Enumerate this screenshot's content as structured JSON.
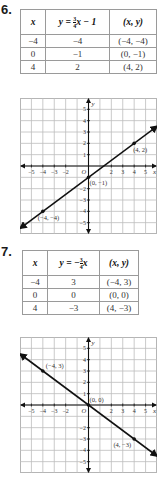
{
  "problems": [
    {
      "number": "6.",
      "table": {
        "headers": [
          "x",
          "y = 3/4x − 1",
          "(x, y)"
        ],
        "header_parts": {
          "y_prefix": "y = ",
          "frac_num": "3",
          "frac_den": "4",
          "y_suffix": "x − 1"
        },
        "rows": [
          [
            "−4",
            "−4",
            "(−4, −4)"
          ],
          [
            "0",
            "−1",
            "(0, −1)"
          ],
          [
            "4",
            "2",
            "(4, 2)"
          ]
        ]
      },
      "graph": {
        "x_label": "x",
        "y_label": "y",
        "origin_label": "O",
        "point_labels": [
          "(4, 2)",
          "(0, −1)",
          "(−4, −4)"
        ]
      }
    },
    {
      "number": "7.",
      "table": {
        "headers": [
          "x",
          "y = −3/4x",
          "(x, y)"
        ],
        "header_parts": {
          "y_prefix": "y = −",
          "frac_num": "3",
          "frac_den": "4",
          "y_suffix": "x"
        },
        "rows": [
          [
            "−4",
            "3",
            "(−4, 3)"
          ],
          [
            "0",
            "0",
            "(0, 0)"
          ],
          [
            "4",
            "−3",
            "(4, −3)"
          ]
        ]
      },
      "graph": {
        "x_label": "x",
        "y_label": "y",
        "origin_label": "O",
        "point_labels": [
          "(−4, 3)",
          "(0, 0)",
          "(4, −3)"
        ]
      }
    }
  ],
  "chart_data": [
    {
      "type": "line",
      "title": "y = 3/4x − 1",
      "xlabel": "x",
      "ylabel": "y",
      "xlim": [
        -6,
        6
      ],
      "ylim": [
        -6,
        6
      ],
      "grid": true,
      "x_ticks": [
        -5,
        -4,
        -3,
        -2,
        2,
        3,
        4,
        5
      ],
      "y_ticks": [
        -5,
        -4,
        -3,
        -2,
        1,
        2,
        3,
        4,
        5
      ],
      "points": [
        {
          "x": -4,
          "y": -4,
          "label": "(−4, −4)"
        },
        {
          "x": 0,
          "y": -1,
          "label": "(0, −1)"
        },
        {
          "x": 4,
          "y": 2,
          "label": "(4, 2)"
        }
      ],
      "slope": 0.75,
      "intercept": -1
    },
    {
      "type": "line",
      "title": "y = −3/4x",
      "xlabel": "x",
      "ylabel": "y",
      "xlim": [
        -6,
        6
      ],
      "ylim": [
        -6,
        6
      ],
      "grid": true,
      "x_ticks": [
        -5,
        -4,
        -3,
        -2,
        2,
        3,
        4,
        5
      ],
      "y_ticks": [
        -5,
        -4,
        -3,
        -2,
        1,
        2,
        3,
        4,
        5
      ],
      "points": [
        {
          "x": -4,
          "y": 3,
          "label": "(−4, 3)"
        },
        {
          "x": 0,
          "y": 0,
          "label": "(0, 0)"
        },
        {
          "x": 4,
          "y": -3,
          "label": "(4, −3)"
        }
      ],
      "slope": -0.75,
      "intercept": 0
    }
  ]
}
